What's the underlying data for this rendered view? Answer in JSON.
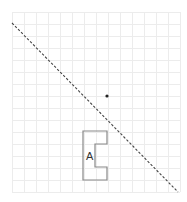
{
  "diagram": {
    "grid": {
      "x0": 12,
      "y0": 12,
      "cols": 14,
      "rows": 15,
      "cell": 12,
      "color": "#ececec"
    },
    "line": {
      "x1": 12,
      "y1": 23,
      "x2": 178,
      "y2": 192,
      "color": "#444444",
      "style": "dashed"
    },
    "point": {
      "x": 107,
      "y": 96,
      "color": "#222222"
    },
    "shape": {
      "label": "A",
      "points": "83,131 107,131 107,144 95,144 95,167 107,167 107,180 83,180",
      "stroke": "#888888"
    }
  }
}
